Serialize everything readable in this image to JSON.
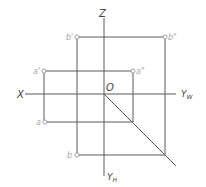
{
  "diagram": {
    "axes": {
      "z": "Z",
      "x": "X",
      "origin": "O",
      "yw": "Y",
      "yw_sub": "W",
      "yh": "Y",
      "yh_sub": "H"
    },
    "points": {
      "b_prime": "b'",
      "b_double": "b\"",
      "a_prime": "a'",
      "a_double": "a\"",
      "a": "a",
      "b": "b"
    },
    "colors": {
      "line": "#5a5a5a",
      "point_label": "#a8a8a8",
      "axis_label": "#444444"
    }
  }
}
